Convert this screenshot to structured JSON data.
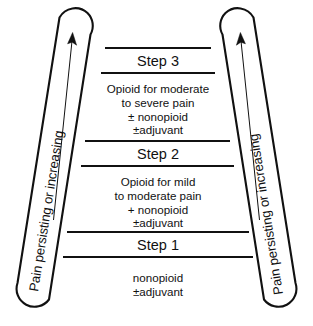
{
  "diagram": {
    "colors": {
      "ink": "#111111",
      "background": "#ffffff"
    },
    "rails": {
      "left": {
        "label": "Pain persisting or increasing",
        "arrow": "up-arrow-icon"
      },
      "right": {
        "label": "Pain persisting or increasing",
        "arrow": "up-arrow-icon"
      }
    },
    "steps": [
      {
        "heading": "Step 3",
        "lines": [
          "Opioid for moderate",
          "to severe pain",
          "± nonopioid",
          "±adjuvant"
        ]
      },
      {
        "heading": "Step 2",
        "lines": [
          "Opioid for mild",
          "to moderate pain",
          "+ nonopioid",
          "±adjuvant"
        ]
      },
      {
        "heading": "Step 1",
        "lines": [
          "nonopioid",
          "±adjuvant"
        ]
      }
    ]
  }
}
